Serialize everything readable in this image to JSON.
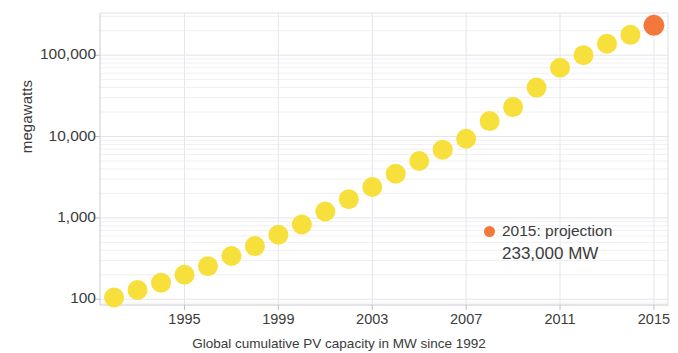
{
  "chart_data": {
    "type": "scatter",
    "title": "",
    "xlabel": "Global cumulative PV capacity in MW since 1992",
    "ylabel": "megawatts",
    "yscale": "log",
    "ylim": [
      85,
      330000
    ],
    "xlim": [
      1991.4,
      2015.6
    ],
    "grid": true,
    "y_ticks": [
      100,
      1000,
      10000,
      100000
    ],
    "y_tick_labels": [
      "100",
      "1,000",
      "10,000",
      "100,000"
    ],
    "x_ticks": [
      1995,
      1999,
      2003,
      2007,
      2011,
      2015
    ],
    "x_tick_labels": [
      "1995",
      "1999",
      "2003",
      "2007",
      "2011",
      "2015"
    ],
    "x": [
      1992,
      1993,
      1994,
      1995,
      1996,
      1997,
      1998,
      1999,
      2000,
      2001,
      2002,
      2003,
      2004,
      2005,
      2006,
      2007,
      2008,
      2009,
      2010,
      2011,
      2012,
      2013,
      2014,
      2015
    ],
    "values": [
      105,
      130,
      160,
      200,
      255,
      340,
      450,
      620,
      830,
      1200,
      1700,
      2400,
      3500,
      5000,
      6900,
      9400,
      15500,
      23000,
      40000,
      70000,
      100000,
      138000,
      178000,
      233000
    ],
    "point_colors": [
      "#f7e03c",
      "#f7e03c",
      "#f7e03c",
      "#f7e03c",
      "#f7e03c",
      "#f7e03c",
      "#f7e03c",
      "#f7e03c",
      "#f7e03c",
      "#f7e03c",
      "#f7e03c",
      "#f7e03c",
      "#f7e03c",
      "#f7e03c",
      "#f7e03c",
      "#f7e03c",
      "#f7e03c",
      "#f7e03c",
      "#f7e03c",
      "#f7e03c",
      "#f7e03c",
      "#f7e03c",
      "#f7e03c",
      "#f4783c"
    ],
    "series_color": "#f7e03c",
    "highlight_color": "#f4783c",
    "annotations": [
      {
        "name": "projection-label",
        "line1": "2015: projection",
        "line2": "233,000 MW",
        "marker_color": "#f4783c"
      }
    ]
  },
  "legend": {
    "projection_label": "2015: projection",
    "projection_value": "233,000 MW"
  },
  "axes": {
    "y_title": "megawatts",
    "x_caption": "Global cumulative PV capacity in MW since 1992"
  },
  "colors": {
    "point_yellow": "#f7e03c",
    "point_orange": "#f4783c",
    "grid": "#e9e9ee",
    "axis": "#c9c9d2",
    "text": "#3c3c3c"
  }
}
